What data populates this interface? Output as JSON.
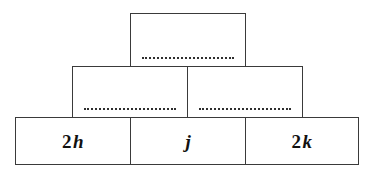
{
  "diagram": {
    "type": "number-pyramid",
    "rows": [
      {
        "row_index": 0,
        "cells": [
          {
            "id": "top-1",
            "filled": false,
            "text": "",
            "blank": "dotted-answer-line"
          }
        ]
      },
      {
        "row_index": 1,
        "cells": [
          {
            "id": "mid-1",
            "filled": false,
            "text": "",
            "blank": "dotted-answer-line"
          },
          {
            "id": "mid-2",
            "filled": false,
            "text": "",
            "blank": "dotted-answer-line"
          }
        ]
      },
      {
        "row_index": 2,
        "cells": [
          {
            "id": "bot-1",
            "filled": true,
            "coefficient": "2",
            "variable": "h",
            "text": "2h"
          },
          {
            "id": "bot-2",
            "filled": true,
            "coefficient": "",
            "variable": "j",
            "text": "j"
          },
          {
            "id": "bot-3",
            "filled": true,
            "coefficient": "2",
            "variable": "k",
            "text": "2k"
          }
        ]
      }
    ]
  },
  "colors": {
    "background": "#ffffff",
    "stroke": "#3a3a3a",
    "text": "#111111",
    "blank": "#2e2e2e"
  }
}
